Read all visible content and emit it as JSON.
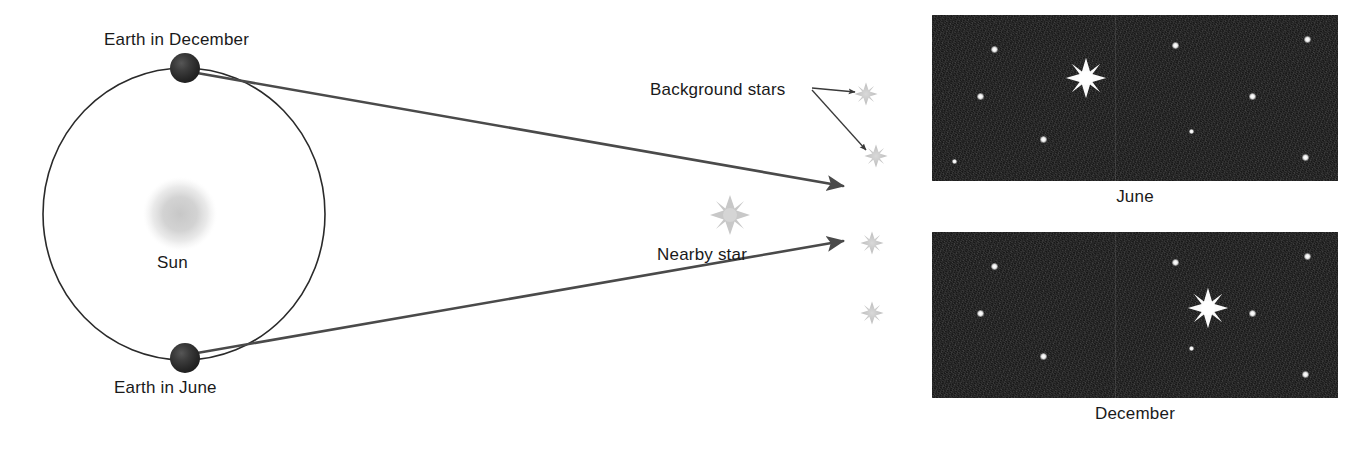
{
  "figure": {
    "background_color": "#ffffff",
    "labels": {
      "earth_december": "Earth in December",
      "earth_june": "Earth in June",
      "sun": "Sun",
      "nearby_star": "Nearby star",
      "background_stars": "Background stars",
      "panel_june": "June",
      "panel_december": "December"
    },
    "colors": {
      "earth": "#2b2b2b",
      "sun": "#cfcfcf",
      "orbit_line": "#2a2a2a",
      "sight_line": "#4a4a4a",
      "leader_line": "#3a3a3a",
      "star_grey": "#c6c6c6",
      "sky_background": "#1b1b1b",
      "panel_star": "#ffffff",
      "text": "#1a1a1a"
    },
    "orbit": {
      "center_x": 184,
      "center_y": 214,
      "radius_x": 141,
      "radius_y": 146
    },
    "sun_body": {
      "cx": 180,
      "cy": 214,
      "r": 34
    },
    "earth_bodies": [
      {
        "name": "earth-december",
        "cx": 185,
        "cy": 68,
        "r": 15
      },
      {
        "name": "earth-june",
        "cx": 185,
        "cy": 358,
        "r": 15
      }
    ],
    "nearby_star_marker": {
      "cx": 730,
      "cy": 215,
      "r": 19
    },
    "sight_lines": [
      {
        "from": "earth-december",
        "x1": 196,
        "y1": 72,
        "x2": 845,
        "y2": 185
      },
      {
        "from": "earth-june",
        "x1": 196,
        "y1": 354,
        "x2": 845,
        "y2": 243
      }
    ],
    "background_star_markers": [
      {
        "cx": 866,
        "cy": 94,
        "r": 11
      },
      {
        "cx": 876,
        "cy": 156,
        "r": 11
      },
      {
        "cx": 872,
        "cy": 243,
        "r": 11
      },
      {
        "cx": 872,
        "cy": 313,
        "r": 11
      }
    ],
    "leader_lines": [
      {
        "x1": 812,
        "y1": 88,
        "x2": 858,
        "y2": 92
      },
      {
        "x1": 812,
        "y1": 92,
        "x2": 868,
        "y2": 152
      }
    ]
  },
  "chart_data": {
    "type": "diagram",
    "panels": [
      {
        "name": "june-sky",
        "label": "June",
        "bright_star": {
          "x_pct": 38.0,
          "y_pct": 38.0
        },
        "background_stars": [
          {
            "x_pct": 15.5,
            "y_pct": 21.0,
            "size": "normal"
          },
          {
            "x_pct": 60.0,
            "y_pct": 18.5,
            "size": "normal"
          },
          {
            "x_pct": 92.5,
            "y_pct": 14.5,
            "size": "normal"
          },
          {
            "x_pct": 12.0,
            "y_pct": 49.0,
            "size": "normal"
          },
          {
            "x_pct": 79.0,
            "y_pct": 49.0,
            "size": "normal"
          },
          {
            "x_pct": 27.5,
            "y_pct": 75.0,
            "size": "normal"
          },
          {
            "x_pct": 64.0,
            "y_pct": 70.0,
            "size": "small"
          },
          {
            "x_pct": 92.0,
            "y_pct": 86.0,
            "size": "normal"
          },
          {
            "x_pct": 5.5,
            "y_pct": 88.0,
            "size": "small"
          }
        ]
      },
      {
        "name": "december-sky",
        "label": "December",
        "bright_star": {
          "x_pct": 68.0,
          "y_pct": 46.0
        },
        "background_stars": [
          {
            "x_pct": 15.5,
            "y_pct": 21.0,
            "size": "normal"
          },
          {
            "x_pct": 60.0,
            "y_pct": 18.5,
            "size": "normal"
          },
          {
            "x_pct": 92.5,
            "y_pct": 14.5,
            "size": "normal"
          },
          {
            "x_pct": 12.0,
            "y_pct": 49.0,
            "size": "normal"
          },
          {
            "x_pct": 79.0,
            "y_pct": 49.0,
            "size": "normal"
          },
          {
            "x_pct": 27.5,
            "y_pct": 75.0,
            "size": "normal"
          },
          {
            "x_pct": 64.0,
            "y_pct": 70.0,
            "size": "small"
          },
          {
            "x_pct": 92.0,
            "y_pct": 86.0,
            "size": "normal"
          }
        ]
      }
    ]
  }
}
